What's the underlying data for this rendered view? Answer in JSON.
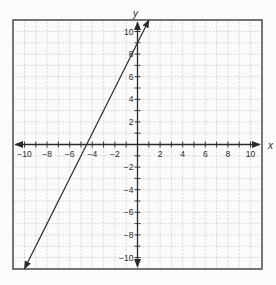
{
  "chart_data": {
    "type": "line",
    "title": "",
    "xlabel": "x",
    "ylabel": "y",
    "xlim": [
      -11,
      11
    ],
    "ylim": [
      -11,
      11
    ],
    "grid": true,
    "grid_step": 1,
    "xticks": [
      -10,
      -8,
      -6,
      -4,
      -2,
      2,
      4,
      6,
      8,
      10
    ],
    "yticks": [
      -10,
      -8,
      -6,
      -4,
      -2,
      2,
      4,
      6,
      8,
      10
    ],
    "tick_labels": {
      "x": [
        "−10",
        "−8",
        "−6",
        "−4",
        "−2",
        "2",
        "4",
        "6",
        "8",
        "10"
      ],
      "y": [
        "−10",
        "−8",
        "−6",
        "−4",
        "−2",
        "2",
        "4",
        "6",
        "8",
        "10"
      ]
    },
    "series": [
      {
        "name": "y = 2x + 9",
        "equation": {
          "slope": 2,
          "intercept": 9
        },
        "x": [
          -10,
          1
        ],
        "y": [
          -11,
          11
        ],
        "arrows_both_ends": true
      }
    ],
    "legend": null
  },
  "colors": {
    "background": "#fbfbfb",
    "grid": "#c8c8c8",
    "frame": "#555555",
    "axis": "#2a2a2a",
    "line": "#2a2a2a"
  }
}
